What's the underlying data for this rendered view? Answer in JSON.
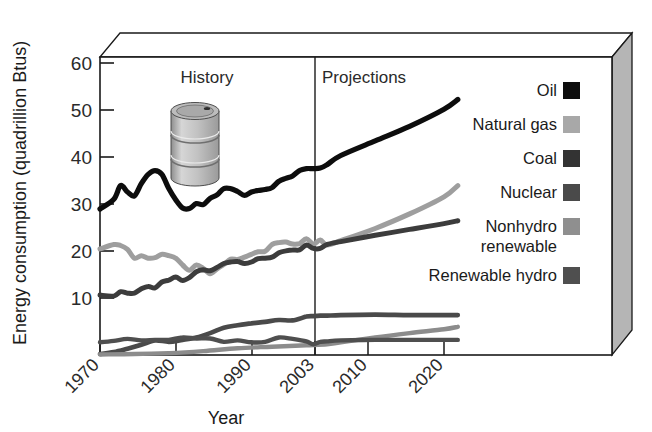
{
  "chart_data": {
    "type": "line",
    "title": "",
    "xlabel": "Year",
    "ylabel": "Energy consumption (quadrillion Btus)",
    "xlim": [
      1970,
      2025
    ],
    "ylim": [
      0,
      60
    ],
    "yticks": [
      10,
      20,
      30,
      40,
      50,
      60
    ],
    "xticks": [
      1970,
      1980,
      1990,
      2003,
      2010,
      2020
    ],
    "grid": false,
    "legend_position": "right-outside",
    "annotations": [
      {
        "label": "History",
        "x": 1986
      },
      {
        "label": "Projections",
        "x": 2012
      }
    ],
    "divider_year": 2003,
    "decoration": "oil-barrel-illustration",
    "series": [
      {
        "name": "Oil",
        "color": "#0d0d0d",
        "x": [
          1970,
          1972,
          1973,
          1974,
          1975,
          1976,
          1977,
          1978,
          1979,
          1980,
          1981,
          1982,
          1983,
          1984,
          1985,
          1986,
          1987,
          1988,
          1989,
          1990,
          1991,
          1992,
          1993,
          1994,
          1995,
          1996,
          1997,
          1998,
          1999,
          2000,
          2001,
          2002,
          2003,
          2005,
          2010,
          2015,
          2020,
          2022
        ],
        "values": [
          30.0,
          32.0,
          34.8,
          33.5,
          32.7,
          35.2,
          37.1,
          37.9,
          37.1,
          34.2,
          31.9,
          30.2,
          30.1,
          31.1,
          30.9,
          32.2,
          32.9,
          34.2,
          34.2,
          33.6,
          32.8,
          33.5,
          33.8,
          34.0,
          34.4,
          35.7,
          36.3,
          36.8,
          37.9,
          38.3,
          38.3,
          38.4,
          39.1,
          41.0,
          44.0,
          47.0,
          50.5,
          52.5
        ]
      },
      {
        "name": "Natural gas",
        "color": "#9e9e9e",
        "x": [
          1970,
          1972,
          1973,
          1974,
          1975,
          1976,
          1977,
          1978,
          1979,
          1980,
          1981,
          1982,
          1983,
          1984,
          1985,
          1986,
          1987,
          1988,
          1989,
          1990,
          1991,
          1992,
          1993,
          1994,
          1995,
          1996,
          1997,
          1998,
          1999,
          2000,
          2001,
          2002,
          2003,
          2005,
          2010,
          2015,
          2020,
          2022
        ],
        "values": [
          21.8,
          22.7,
          22.5,
          21.7,
          19.9,
          20.4,
          19.9,
          20.0,
          20.7,
          20.4,
          19.9,
          18.5,
          17.4,
          18.5,
          17.8,
          16.7,
          17.7,
          18.6,
          19.7,
          19.6,
          20.1,
          20.7,
          21.2,
          21.3,
          22.7,
          23.1,
          23.2,
          22.8,
          22.9,
          23.9,
          22.8,
          23.6,
          22.6,
          23.5,
          26.0,
          29.0,
          32.5,
          34.8
        ]
      },
      {
        "name": "Coal",
        "color": "#3c3c3c",
        "x": [
          1970,
          1972,
          1973,
          1974,
          1975,
          1976,
          1977,
          1978,
          1979,
          1980,
          1981,
          1982,
          1983,
          1984,
          1985,
          1986,
          1987,
          1988,
          1989,
          1990,
          1991,
          1992,
          1993,
          1994,
          1995,
          1996,
          1997,
          1998,
          1999,
          2000,
          2001,
          2002,
          2003,
          2005,
          2010,
          2015,
          2020,
          2022
        ],
        "values": [
          12.3,
          12.1,
          13.0,
          12.7,
          12.7,
          13.6,
          14.1,
          13.8,
          15.0,
          15.4,
          16.0,
          15.3,
          15.9,
          17.1,
          17.5,
          17.3,
          18.0,
          18.8,
          19.1,
          19.2,
          18.8,
          19.1,
          19.8,
          19.9,
          20.1,
          21.0,
          21.4,
          21.6,
          21.6,
          22.6,
          21.9,
          21.9,
          22.7,
          23.3,
          24.6,
          25.8,
          27.0,
          27.6
        ]
      },
      {
        "name": "Nuclear",
        "color": "#4a4a4a",
        "x": [
          1970,
          1972,
          1974,
          1976,
          1978,
          1980,
          1982,
          1984,
          1986,
          1988,
          1990,
          1992,
          1994,
          1996,
          1998,
          2000,
          2001,
          2002,
          2003,
          2005,
          2010,
          2015,
          2020,
          2022
        ],
        "values": [
          0.2,
          0.6,
          1.3,
          2.1,
          3.0,
          2.7,
          3.1,
          3.6,
          4.5,
          5.6,
          6.1,
          6.5,
          6.8,
          7.2,
          7.1,
          7.9,
          8.0,
          8.1,
          8.1,
          8.2,
          8.3,
          8.2,
          8.2,
          8.2
        ]
      },
      {
        "name": "Nonhydro renewable",
        "color": "#8c8c8c",
        "x": [
          1970,
          1975,
          1980,
          1985,
          1990,
          1995,
          2000,
          2003,
          2005,
          2010,
          2015,
          2020,
          2022
        ],
        "values": [
          0.1,
          0.2,
          0.4,
          0.8,
          1.4,
          1.7,
          2.0,
          2.2,
          2.6,
          3.6,
          4.5,
          5.3,
          5.8
        ]
      },
      {
        "name": "Renewable hydro",
        "color": "#4f4f4f",
        "x": [
          1970,
          1972,
          1974,
          1976,
          1978,
          1980,
          1982,
          1984,
          1986,
          1988,
          1990,
          1992,
          1994,
          1996,
          1998,
          2000,
          2001,
          2002,
          2003,
          2005,
          2010,
          2015,
          2020,
          2022
        ],
        "values": [
          2.6,
          2.9,
          3.3,
          3.0,
          3.1,
          3.1,
          3.6,
          3.4,
          3.4,
          2.7,
          3.0,
          2.6,
          2.7,
          3.6,
          3.3,
          2.8,
          2.2,
          2.7,
          2.8,
          3.0,
          3.1,
          3.1,
          3.1,
          3.1
        ]
      }
    ]
  },
  "axis": {
    "y_title": "Energy consumption (quadrillion Btus)",
    "x_title": "Year",
    "y_labels": [
      "60",
      "50",
      "40",
      "30",
      "20",
      "10"
    ],
    "x_labels": [
      "1970",
      "1980",
      "1990",
      "2003",
      "2010",
      "2020"
    ]
  },
  "bands": {
    "history": "History",
    "projections": "Projections"
  },
  "legend": {
    "items": [
      {
        "label": "Oil",
        "color": "#0d0d0d"
      },
      {
        "label": "Natural gas",
        "color": "#a8a8a8"
      },
      {
        "label": "Coal",
        "color": "#333333"
      },
      {
        "label": "Nuclear",
        "color": "#4a4a4a"
      },
      {
        "label": "Nonhydro",
        "label2": "renewable",
        "color": "#8f8f8f"
      },
      {
        "label": "Renewable hydro",
        "color": "#4f4f4f"
      }
    ]
  },
  "colors": {
    "frame": "#1a1a1a",
    "panel_side": "#b5b5b5",
    "panel_top": "#ffffff",
    "background": "#ffffff"
  }
}
